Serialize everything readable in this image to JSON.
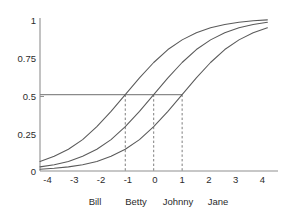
{
  "chart_data": {
    "type": "line",
    "title": "",
    "subtitle": "",
    "xlabel": "",
    "ylabel": "",
    "xlim": [
      -4,
      4
    ],
    "ylim": [
      0,
      1
    ],
    "grid": false,
    "legend": "none",
    "x_ticks": [
      "-4",
      "-3",
      "-2",
      "-1",
      "0",
      "1",
      "2",
      "3",
      "4"
    ],
    "x_tick_values": [
      -4,
      -3,
      -2,
      -1,
      0,
      1,
      2,
      3,
      4
    ],
    "y_ticks": [
      "0",
      "0.25",
      "0.5",
      "0.75",
      "1"
    ],
    "y_tick_values": [
      0,
      0.25,
      0.5,
      0.75,
      1
    ],
    "series": [
      {
        "name": "curve-left",
        "midpoint": -1,
        "slope": 0.9,
        "x": [
          -4,
          -3.5,
          -3,
          -2.5,
          -2,
          -1.5,
          -1,
          -0.5,
          0,
          0.5,
          1,
          1.5,
          2,
          2.5,
          3,
          3.5,
          4
        ],
        "values": [
          0.062,
          0.096,
          0.142,
          0.205,
          0.29,
          0.39,
          0.5,
          0.61,
          0.71,
          0.795,
          0.858,
          0.905,
          0.937,
          0.959,
          0.973,
          0.983,
          0.989
        ]
      },
      {
        "name": "curve-middle",
        "midpoint": 0,
        "slope": 0.9,
        "x": [
          -4,
          -3.5,
          -3,
          -2.5,
          -2,
          -1.5,
          -1,
          -0.5,
          0,
          0.5,
          1,
          1.5,
          2,
          2.5,
          3,
          3.5,
          4
        ],
        "values": [
          0.027,
          0.041,
          0.062,
          0.096,
          0.142,
          0.205,
          0.29,
          0.39,
          0.5,
          0.61,
          0.71,
          0.795,
          0.858,
          0.905,
          0.937,
          0.959,
          0.973
        ]
      },
      {
        "name": "curve-right",
        "midpoint": 1,
        "slope": 0.9,
        "x": [
          -4,
          -3.5,
          -3,
          -2.5,
          -2,
          -1.5,
          -1,
          -0.5,
          0,
          0.5,
          1,
          1.5,
          2,
          2.5,
          3,
          3.5,
          4
        ],
        "values": [
          0.012,
          0.018,
          0.027,
          0.041,
          0.062,
          0.096,
          0.142,
          0.205,
          0.29,
          0.39,
          0.5,
          0.61,
          0.71,
          0.795,
          0.858,
          0.905,
          0.937
        ]
      }
    ],
    "reference_line": {
      "orientation": "horizontal",
      "y": 0.5,
      "x_start": -4,
      "x_end": 1
    },
    "drop_lines": {
      "orientation": "vertical",
      "y_top": 0.5,
      "y_bottom": 0,
      "x_values": [
        -1,
        0,
        1
      ]
    },
    "annotations": [
      {
        "label": "Bill",
        "x": -2.5
      },
      {
        "label": "Betty",
        "x": -0.5
      },
      {
        "label": "Johnny",
        "x": 0.5
      },
      {
        "label": "Jane",
        "x": 2.0
      }
    ]
  }
}
